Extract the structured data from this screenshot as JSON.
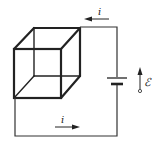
{
  "diagram": {
    "title": "",
    "labels": {
      "current_top": "i",
      "current_bottom": "i",
      "emf": "ℰ"
    },
    "elements": [
      "wire-cube",
      "battery",
      "current-arrow-top",
      "current-arrow-bottom",
      "emf-arrow"
    ],
    "colors": {
      "line": "#222222",
      "background": "#ffffff"
    }
  }
}
